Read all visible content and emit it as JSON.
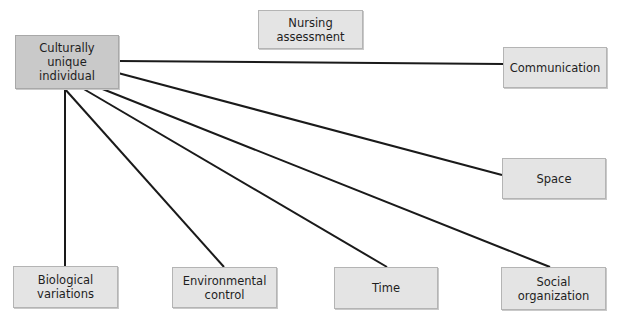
{
  "diagram": {
    "type": "hub-and-spoke concept diagram",
    "nodes": {
      "central": "Culturally\nunique\nindividual",
      "nursing": "Nursing\nassessment",
      "communication": "Communication",
      "space": "Space",
      "biological": "Biological\nvariations",
      "environmental": "Environmental\ncontrol",
      "time": "Time",
      "social": "Social\norganization"
    },
    "edges": [
      {
        "from": "central",
        "to": "communication"
      },
      {
        "from": "central",
        "to": "space"
      },
      {
        "from": "central",
        "to": "social"
      },
      {
        "from": "central",
        "to": "time"
      },
      {
        "from": "central",
        "to": "environmental"
      },
      {
        "from": "central",
        "to": "biological"
      }
    ],
    "colors": {
      "central_fill": "#c9c9c9",
      "node_fill": "#e4e4e4",
      "line": "#1a1a1a"
    }
  }
}
